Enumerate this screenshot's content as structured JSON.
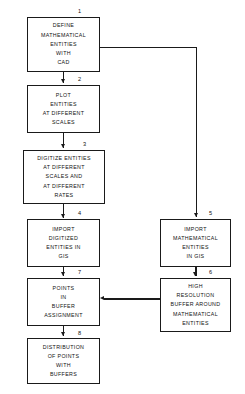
{
  "diagram": {
    "type": "flowchart",
    "orientation": "top-to-bottom, two columns",
    "line_color": "#1a1a1a",
    "background_color": "#ffffff",
    "nodes": [
      {
        "number": "1",
        "name": "define-mathematical-entities-with-cad",
        "text": "DEFINE\nMATHEMATICAL\nENTITIES\nWITH\nCAD",
        "column": "left"
      },
      {
        "number": "2",
        "name": "plot-entities-at-different-scales",
        "text": "PLOT\nENTITIES\nAT DIFFERENT\nSCALES",
        "column": "left"
      },
      {
        "number": "3",
        "name": "digitize-entities-at-different-scales-and-rates",
        "text": "DIGITIZE ENTITIES\nAT DIFFERENT\nSCALES AND\nAT DIFFERENT\nRATES",
        "column": "left"
      },
      {
        "number": "4",
        "name": "import-digitized-entities-in-gis",
        "text": "IMPORT\nDIGITIZED\nENTITIES IN\nGIS",
        "column": "left"
      },
      {
        "number": "5",
        "name": "import-mathematical-entities-in-gis",
        "text": "IMPORT\nMATHEMATICAL\nENTITIES\nIN GIS",
        "column": "right"
      },
      {
        "number": "6",
        "name": "high-resolution-buffer-around-mathematical-entities",
        "text": "HIGH\nRESOLUTION\nBUFFER AROUND\nMATHEMATICAL\nENTITIES",
        "column": "right"
      },
      {
        "number": "7",
        "name": "points-in-buffer-assignment",
        "text": "POINTS\nIN\nBUFFER\nASSIGNMENT",
        "column": "left"
      },
      {
        "number": "8",
        "name": "distribution-of-points-with-buffers",
        "text": "DISTRIBUTION\nOF POINTS\nWITH\nBUFFERS",
        "column": "left"
      }
    ],
    "connections": [
      {
        "from": "1",
        "to": "2",
        "kind": "vertical-arrow"
      },
      {
        "from": "2",
        "to": "3",
        "kind": "vertical-arrow"
      },
      {
        "from": "3",
        "to": "4",
        "kind": "vertical-arrow"
      },
      {
        "from": "4",
        "to": "7",
        "kind": "vertical-arrow"
      },
      {
        "from": "7",
        "to": "8",
        "kind": "vertical-arrow"
      },
      {
        "from": "1",
        "to": "5",
        "kind": "right-then-down-arrow"
      },
      {
        "from": "5",
        "to": "6",
        "kind": "vertical-arrow"
      },
      {
        "from": "6",
        "to": "7",
        "kind": "horizontal-left-arrow"
      }
    ]
  }
}
